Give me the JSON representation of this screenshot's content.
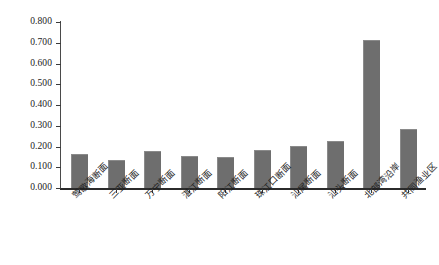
{
  "chart_data": {
    "type": "bar",
    "title": "",
    "subtitle": "",
    "xlabel": "",
    "ylabel": "",
    "ylim": [
      0.0,
      0.8
    ],
    "ytick_labels": [
      "0.800",
      "0.700",
      "0.600",
      "0.500",
      "0.400",
      "0.300",
      "0.200",
      "0.100",
      "0.000"
    ],
    "ytick_values": [
      0.8,
      0.7,
      0.6,
      0.5,
      0.4,
      0.3,
      0.2,
      0.1,
      0.0
    ],
    "grid": false,
    "legend": null,
    "bar_color": "#6e6e6e",
    "axis_color": "#2b2b2b",
    "background": "#ffffff",
    "categories": [
      "莺歌海断面",
      "三亚断面",
      "万宁断面",
      "湛江断面",
      "阳江断面",
      "珠江口断面",
      "汕尾断面",
      "汕头断面",
      "北部湾沿岸",
      "共同渔业区"
    ],
    "values": [
      0.16,
      0.13,
      0.175,
      0.15,
      0.145,
      0.18,
      0.2,
      0.22,
      0.71,
      0.28
    ]
  }
}
